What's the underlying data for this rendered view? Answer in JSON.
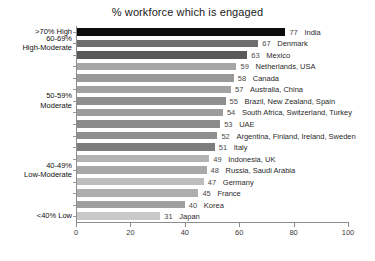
{
  "chart_data": {
    "type": "bar",
    "orientation": "horizontal",
    "title": "% workforce which is engaged",
    "xlabel": "",
    "ylabel": "",
    "xlim": [
      0,
      100
    ],
    "xticks": [
      0,
      20,
      40,
      60,
      80,
      100
    ],
    "grid": false,
    "legend": null,
    "categories": [
      "India",
      "Denmark",
      "Mexico",
      "Netherlands, USA",
      "Canada",
      "Australia, China",
      "Brazil, New Zealand, Spain",
      "South Africa, Switzerland, Turkey",
      "UAE",
      "Argentina, Finland, Ireland, Sweden",
      "Italy",
      "Indonesia, UK",
      "Russia, Saudi Arabia",
      "Germany",
      "France",
      "Korea",
      "Japan"
    ],
    "values": [
      77,
      67,
      63,
      59,
      58,
      57,
      55,
      54,
      53,
      52,
      51,
      49,
      48,
      47,
      45,
      40,
      31
    ],
    "bar_colors": [
      "#0d0d0d",
      "#6e6e6e",
      "#5a5a5a",
      "#a6a6a6",
      "#9a9a9a",
      "#a2a2a2",
      "#8f8f8f",
      "#9c9c9c",
      "#8a8a8a",
      "#8f8f8f",
      "#7d7d7d",
      "#b4b4b4",
      "#a8a8a8",
      "#bdbdbd",
      "#aeaeae",
      "#9f9f9f",
      "#c9c9c9"
    ],
    "group_bands": [
      {
        "label_lines": [
          ">70% High"
        ],
        "row_index": 0
      },
      {
        "label_lines": [
          "60-69%",
          "High-Moderate"
        ],
        "row_index": 1
      },
      {
        "label_lines": [
          "50-59%",
          "Moderate"
        ],
        "row_index": 6
      },
      {
        "label_lines": [
          "40-49%",
          "Low-Moderate"
        ],
        "row_index": 12
      },
      {
        "label_lines": [
          "<40% Low"
        ],
        "row_index": 16
      }
    ]
  },
  "axis": {
    "tick_labels": [
      "0",
      "20",
      "40",
      "60",
      "80",
      "100"
    ]
  }
}
